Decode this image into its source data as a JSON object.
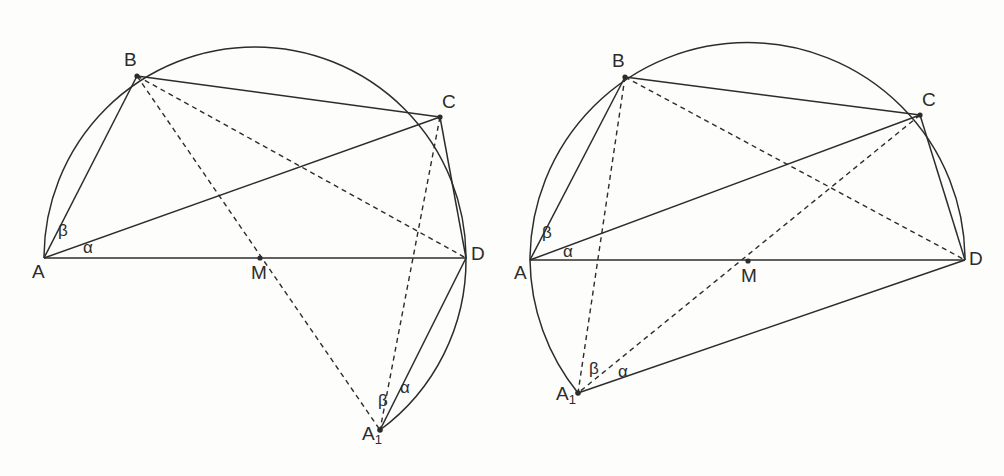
{
  "figure": {
    "type": "geometry-diagram",
    "background_color": "#fdfdfb",
    "stroke_color": "#2c2c2c",
    "panels": [
      {
        "id": "left-panel",
        "name": "left-figure",
        "circle": {
          "cx": 255,
          "cy": 250,
          "r": 211
        },
        "points": [
          {
            "name": "A",
            "label": "A",
            "x": 44,
            "y": 258,
            "label_x": 32,
            "label_y": 262,
            "dot": false
          },
          {
            "name": "B",
            "label": "B",
            "x": 137,
            "y": 76,
            "label_x": 124,
            "label_y": 50,
            "dot": true
          },
          {
            "name": "C",
            "label": "C",
            "x": 440,
            "y": 117,
            "label_x": 442,
            "label_y": 92,
            "dot": true
          },
          {
            "name": "D",
            "label": "D",
            "x": 466,
            "y": 258,
            "label_x": 471,
            "label_y": 244,
            "dot": false
          },
          {
            "name": "M",
            "label": "M",
            "x": 260,
            "y": 258,
            "label_x": 251,
            "label_y": 263,
            "dot": true
          },
          {
            "name": "A1",
            "label": "A",
            "sub": "1",
            "x": 380,
            "y": 430,
            "label_x": 362,
            "label_y": 424,
            "dot": true
          }
        ],
        "angle_labels": [
          {
            "name": "beta-at-A",
            "text": "β",
            "x": 58,
            "y": 222
          },
          {
            "name": "alpha-at-A",
            "text": "α",
            "x": 83,
            "y": 239
          },
          {
            "name": "beta-at-A1",
            "text": "β",
            "x": 378,
            "y": 392
          },
          {
            "name": "alpha-at-A1",
            "text": "α",
            "x": 400,
            "y": 379
          }
        ],
        "solid_segments": [
          {
            "name": "segment-A-D",
            "from": "A",
            "to": "D"
          },
          {
            "name": "segment-A-B",
            "from": "A",
            "to": "B"
          },
          {
            "name": "segment-A-C",
            "from": "A",
            "to": "C"
          },
          {
            "name": "segment-B-C",
            "from": "B",
            "to": "C"
          },
          {
            "name": "segment-C-D",
            "from": "C",
            "to": "D"
          },
          {
            "name": "segment-D-A1",
            "from": "D",
            "to": "A1"
          }
        ],
        "dashed_segments": [
          {
            "name": "segment-B-D",
            "from": "B",
            "to": "D"
          },
          {
            "name": "segment-B-A1",
            "from": "B",
            "to": "A1"
          },
          {
            "name": "segment-C-A1",
            "from": "C",
            "to": "A1"
          }
        ],
        "arcs": [
          {
            "name": "arc-A-to-D-upper",
            "from": "A",
            "to": "D",
            "through_top": true
          },
          {
            "name": "arc-D-to-A1-lower",
            "from": "D",
            "to": "A1"
          }
        ]
      },
      {
        "id": "right-panel",
        "name": "right-figure",
        "circle": {
          "cx": 744,
          "cy": 252,
          "r": 216
        },
        "points": [
          {
            "name": "A",
            "label": "A",
            "x": 530,
            "y": 260,
            "label_x": 514,
            "label_y": 263,
            "dot": false
          },
          {
            "name": "B",
            "label": "B",
            "x": 625,
            "y": 77,
            "label_x": 612,
            "label_y": 51,
            "dot": true
          },
          {
            "name": "C",
            "label": "C",
            "x": 920,
            "y": 115,
            "label_x": 922,
            "label_y": 90,
            "dot": true
          },
          {
            "name": "D",
            "label": "D",
            "x": 965,
            "y": 260,
            "label_x": 969,
            "label_y": 249,
            "dot": false
          },
          {
            "name": "M",
            "label": "M",
            "x": 748,
            "y": 261,
            "label_x": 741,
            "label_y": 266,
            "dot": true
          },
          {
            "name": "A1",
            "label": "A",
            "sub": "1",
            "x": 578,
            "y": 393,
            "label_x": 556,
            "label_y": 384,
            "dot": true
          }
        ],
        "angle_labels": [
          {
            "name": "beta-at-A",
            "text": "β",
            "x": 542,
            "y": 224
          },
          {
            "name": "alpha-at-A",
            "text": "α",
            "x": 563,
            "y": 243
          },
          {
            "name": "beta-at-A1",
            "text": "β",
            "x": 589,
            "y": 360
          },
          {
            "name": "alpha-at-A1",
            "text": "α",
            "x": 618,
            "y": 363
          }
        ],
        "solid_segments": [
          {
            "name": "segment-A-D",
            "from": "A",
            "to": "D"
          },
          {
            "name": "segment-A-B",
            "from": "A",
            "to": "B"
          },
          {
            "name": "segment-A-C",
            "from": "A",
            "to": "C"
          },
          {
            "name": "segment-B-C",
            "from": "B",
            "to": "C"
          },
          {
            "name": "segment-C-D",
            "from": "C",
            "to": "D"
          },
          {
            "name": "segment-D-A1",
            "from": "D",
            "to": "A1"
          }
        ],
        "dashed_segments": [
          {
            "name": "segment-B-D",
            "from": "B",
            "to": "D"
          },
          {
            "name": "segment-B-A1",
            "from": "B",
            "to": "A1"
          },
          {
            "name": "segment-C-A1",
            "from": "C",
            "to": "A1"
          }
        ],
        "arcs": [
          {
            "name": "arc-A-to-D-upper",
            "from": "A",
            "to": "D",
            "through_top": true
          },
          {
            "name": "arc-A-to-A1-lower",
            "from": "A",
            "to": "A1"
          }
        ]
      }
    ]
  }
}
